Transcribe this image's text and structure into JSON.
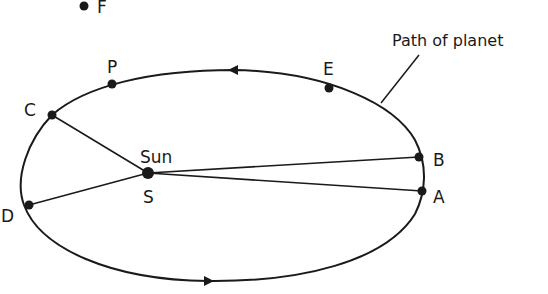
{
  "diagram": {
    "caption_label": "Path of planet",
    "sun": {
      "name": "Sun",
      "symbol": "S"
    },
    "points": {
      "A": "A",
      "B": "B",
      "C": "C",
      "D": "D",
      "E": "E",
      "F": "F",
      "P": "P"
    },
    "connections": [
      [
        "S",
        "A"
      ],
      [
        "S",
        "B"
      ],
      [
        "S",
        "C"
      ],
      [
        "S",
        "D"
      ]
    ],
    "direction": "counter-clockwise (arrow at top points left, arrow at bottom points right)",
    "colors": {
      "line": "#1a1a1a",
      "background": "#ffffff"
    }
  }
}
